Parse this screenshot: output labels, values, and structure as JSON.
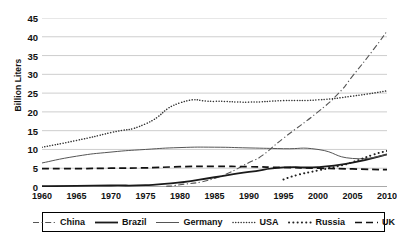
{
  "chart_data": {
    "type": "line",
    "title": "",
    "xlabel": "",
    "ylabel": "Billion Liters",
    "xlim": [
      1960,
      2010
    ],
    "ylim": [
      0,
      45
    ],
    "yticks": [
      0,
      5,
      10,
      15,
      20,
      25,
      30,
      35,
      40,
      45
    ],
    "xticks": [
      1960,
      1965,
      1970,
      1975,
      1980,
      1985,
      1990,
      1995,
      2000,
      2005,
      2010
    ],
    "grid": "horizontal",
    "legend_position": "bottom",
    "series": [
      {
        "name": "China",
        "style": "dash-dot",
        "color": "#555555",
        "x": [
          1978,
          1980,
          1985,
          1990,
          1992,
          1995,
          2000,
          2003,
          2005,
          2008,
          2010
        ],
        "values": [
          0.2,
          0.6,
          2.3,
          6.5,
          8.5,
          13.0,
          20.0,
          25.0,
          29.5,
          36.5,
          41.5
        ]
      },
      {
        "name": "Brazil",
        "style": "solid-thick",
        "color": "#1a1a1a",
        "x": [
          1960,
          1965,
          1970,
          1975,
          1980,
          1985,
          1990,
          1995,
          2000,
          2005,
          2010
        ],
        "values": [
          0.2,
          0.3,
          0.4,
          0.5,
          1.2,
          2.6,
          4.0,
          5.2,
          5.3,
          6.5,
          8.7
        ]
      },
      {
        "name": "Germany",
        "style": "solid-thin",
        "color": "#555555",
        "x": [
          1960,
          1965,
          1970,
          1975,
          1980,
          1985,
          1990,
          1995,
          2000,
          2005,
          2010
        ],
        "values": [
          6.4,
          8.2,
          9.3,
          10.0,
          10.5,
          10.6,
          10.4,
          10.2,
          10.0,
          7.6,
          8.6
        ]
      },
      {
        "name": "USA",
        "style": "dotted-fine",
        "color": "#333333",
        "x": [
          1960,
          1965,
          1970,
          1975,
          1980,
          1985,
          1990,
          1995,
          2000,
          2005,
          2010
        ],
        "values": [
          10.6,
          12.4,
          14.5,
          16.8,
          22.4,
          22.8,
          22.6,
          23.0,
          23.2,
          24.2,
          25.6
        ]
      },
      {
        "name": "Russia",
        "style": "dotted-coarse",
        "color": "#222222",
        "x": [
          1995,
          1997,
          2000,
          2003,
          2005,
          2008,
          2010
        ],
        "values": [
          2.0,
          3.2,
          4.4,
          5.6,
          6.6,
          8.6,
          9.6
        ]
      },
      {
        "name": "UK",
        "style": "dashed",
        "color": "#111111",
        "x": [
          1960,
          1965,
          1970,
          1975,
          1980,
          1985,
          1990,
          1995,
          2000,
          2005,
          2010
        ],
        "values": [
          4.9,
          4.9,
          5.0,
          5.1,
          5.4,
          5.5,
          5.4,
          5.2,
          5.0,
          4.8,
          4.6
        ]
      }
    ]
  }
}
